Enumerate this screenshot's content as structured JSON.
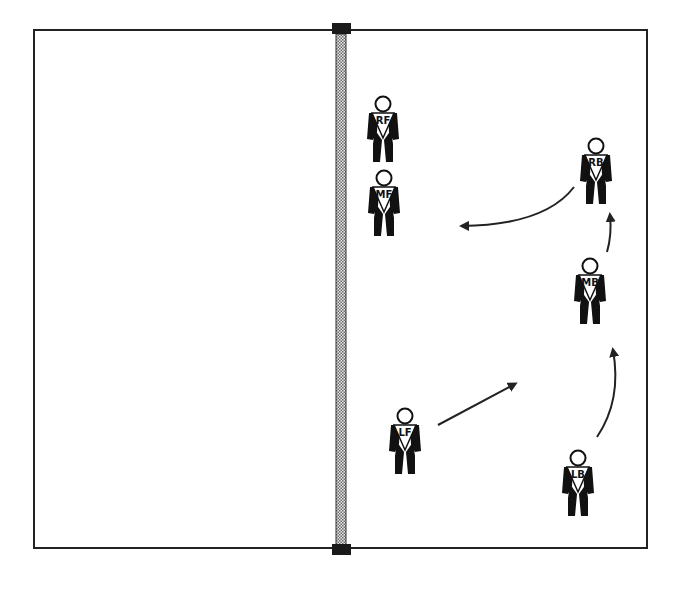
{
  "court": {
    "x": 34,
    "y": 30,
    "width": 613,
    "height": 518,
    "line_color": "#222222",
    "background": "#ffffff"
  },
  "net": {
    "x": 336,
    "width": 10,
    "top": 30,
    "bottom": 548,
    "post_color": "#1a1a1a",
    "mesh_color": "#9a9a9a"
  },
  "players": [
    {
      "label": "RF",
      "x": 383,
      "y": 96
    },
    {
      "label": "MF",
      "x": 384,
      "y": 170
    },
    {
      "label": "RB",
      "x": 596,
      "y": 138
    },
    {
      "label": "MB",
      "x": 590,
      "y": 258
    },
    {
      "label": "LF",
      "x": 405,
      "y": 408
    },
    {
      "label": "LB",
      "x": 578,
      "y": 450
    }
  ],
  "arrows": [
    {
      "name": "rb-arrow",
      "path": "M 574 187 Q 545 225 462 226",
      "head": [
        462,
        226
      ],
      "angle": 180
    },
    {
      "name": "mb-up-arrow",
      "path": "M 607 252 Q 612 235 610 215",
      "head": [
        610,
        215
      ],
      "angle": -92
    },
    {
      "name": "lf-arrow",
      "path": "M 438 425 L 515 384",
      "head": [
        515,
        384
      ],
      "angle": -28
    },
    {
      "name": "lb-arrow",
      "path": "M 597 437 Q 622 400 613 350",
      "head": [
        613,
        350
      ],
      "angle": -100
    }
  ],
  "colors": {
    "figure": "#111111",
    "arrow": "#222222"
  }
}
